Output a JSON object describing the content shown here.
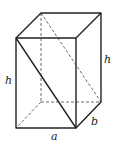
{
  "diagram": {
    "labels": {
      "height_left": "h",
      "height_right": "h",
      "width": "a",
      "depth": "b"
    },
    "colors": {
      "stroke": "#222222",
      "background": "#ffffff"
    }
  }
}
